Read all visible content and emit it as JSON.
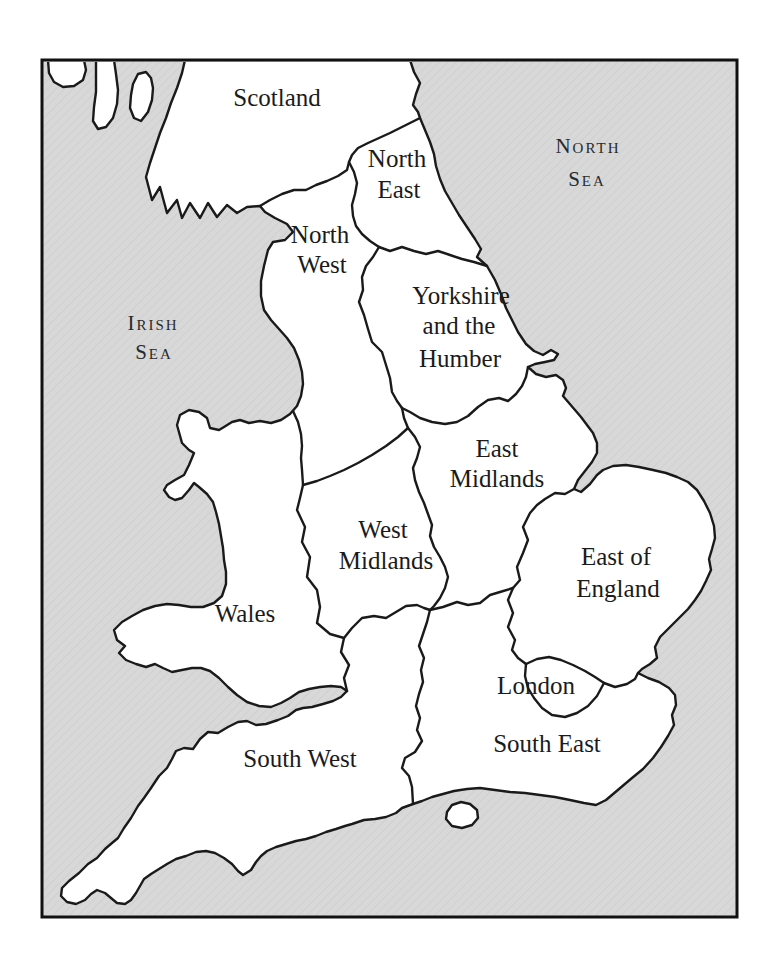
{
  "map": {
    "colors": {
      "sea": "#d8d8d8",
      "sea_hatch": "#c9c9c9",
      "land": "#ffffff",
      "outline": "#1a1a1a",
      "frame": "#111111",
      "label": "#1b1b1b"
    },
    "sea_labels": {
      "north_sea": {
        "lines": [
          "North",
          "Sea"
        ]
      },
      "irish_sea": {
        "lines": [
          "Irish",
          "Sea"
        ]
      }
    },
    "region_labels": {
      "scotland": {
        "lines": [
          "Scotland"
        ]
      },
      "north_east": {
        "lines": [
          "North",
          "East"
        ]
      },
      "north_west": {
        "lines": [
          "North",
          "West"
        ]
      },
      "yorkshire_humber": {
        "lines": [
          "Yorkshire",
          "and the",
          "Humber"
        ]
      },
      "east_midlands": {
        "lines": [
          "East",
          "Midlands"
        ]
      },
      "west_midlands": {
        "lines": [
          "West",
          "Midlands"
        ]
      },
      "east_of_england": {
        "lines": [
          "East of",
          "England"
        ]
      },
      "wales": {
        "lines": [
          "Wales"
        ]
      },
      "london": {
        "lines": [
          "London"
        ]
      },
      "south_east": {
        "lines": [
          "South East"
        ]
      },
      "south_west": {
        "lines": [
          "South West"
        ]
      }
    }
  }
}
